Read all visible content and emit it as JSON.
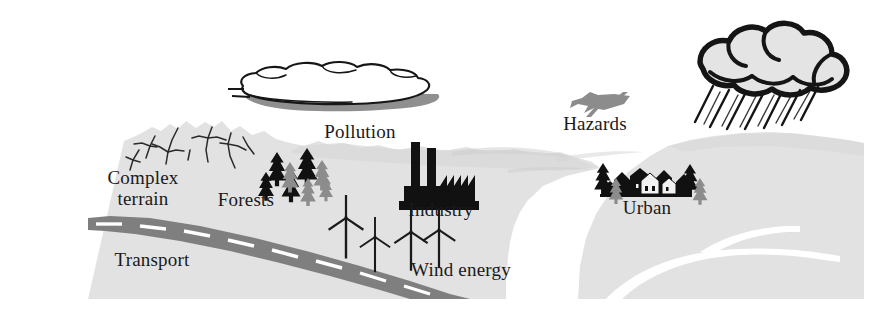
{
  "figure": {
    "kind": "schematic-landscape-illustration",
    "width": 871,
    "height": 314,
    "background_color": "#ffffff"
  },
  "palette": {
    "terrain_fill": "#e2e2e2",
    "terrain_shadow": "#d2d2d2",
    "road_fill": "#7f7f7f",
    "road_dash": "#ffffff",
    "river_fill": "#ffffff",
    "ink_black": "#111111",
    "ink_gray": "#8c8c8c",
    "cloud_fill": "#ffffff",
    "cloud_shadow": "#8f8f8f",
    "rain_cloud_fill": "#e4e4e4",
    "label_color": "#1a1a1a"
  },
  "labels": {
    "complex_terrain": "Complex\nterrain",
    "forests": "Forests",
    "transport": "Transport",
    "pollution": "Pollution",
    "industry": "Industry",
    "wind_energy": "Wind energy",
    "hazards": "Hazards",
    "urban": "Urban"
  },
  "elements": [
    {
      "id": "complex-terrain",
      "label": "Complex terrain",
      "icon": "mountain-icon"
    },
    {
      "id": "forests",
      "label": "Forests",
      "icon": "conifer-trees-icon"
    },
    {
      "id": "transport",
      "label": "Transport",
      "icon": "road-icon"
    },
    {
      "id": "pollution",
      "label": "Pollution",
      "icon": "smog-cloud-icon"
    },
    {
      "id": "industry",
      "label": "Industry",
      "icon": "factory-icon"
    },
    {
      "id": "wind-energy",
      "label": "Wind energy",
      "icon": "wind-turbine-icon"
    },
    {
      "id": "hazards",
      "label": "Hazards",
      "icon": "airplane-icon"
    },
    {
      "id": "urban",
      "label": "Urban",
      "icon": "village-houses-icon"
    },
    {
      "id": "storm",
      "label": "",
      "icon": "rain-cloud-icon"
    }
  ],
  "counts": {
    "wind_turbines": 4,
    "factory_chimneys": 2,
    "trees_forest": 8,
    "trees_urban": 4,
    "rain_streaks": 7
  }
}
